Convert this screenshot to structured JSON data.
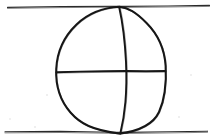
{
  "document": {
    "title": "Hand-drawn sphere construction sketch",
    "medium": "pencil-on-paper-scan",
    "background_color": "#ffffff",
    "ink_color": "#171717",
    "guide_color": "#2a2a2a",
    "width": 214,
    "height": 140
  },
  "figure": {
    "name": "sphere-with-meridian-and-equator",
    "caption": "",
    "labels": []
  },
  "strokes": {
    "top_rule": {
      "name": "top-horizontal-rule",
      "path": "M 7.5 7.4 L 62 6.6 L 112 6.2 L 126 6.4 L 168 6.0 L 209.5 5.4",
      "color": "#2a2a2a"
    },
    "bottom_rule": {
      "name": "bottom-horizontal-rule",
      "path": "M 5.0 131.8 L 60 131.4 L 112 132.2 L 126 132.4 L 170 131.8 L 207.5 131.2",
      "color": "#2a2a2a"
    },
    "circle_outline": {
      "name": "sphere-outline",
      "path": "M 119.5 6.8 C 104 7.6 88 13.5 76.5 24.5 C 64.5 36.0 57.0 52.0 56.2 69.0 C 55.4 86.5 60.5 101.0 70.5 112.5 C 80.5 124.0 92.5 130.0 119.5 133.6 C 143.0 130.5 154.0 122.5 159.0 112.0 C 161.5 106.5 163.4 100.5 164.6 92.0 C 165.8 83.0 166.2 75.0 165.6 66.0 C 164.6 50.0 158.0 34.5 146.5 23.0 C 135.5 12.0 128.5 8.0 119.5 6.8 Z",
      "color": "#171717"
    },
    "meridian": {
      "name": "vertical-meridian-curve",
      "path": "M 119.2 7.2 C 122.5 22.0 125.0 42.0 126.0 62.0 C 126.6 75.5 126.6 88.0 125.4 102.0 C 124.3 114.5 122.5 124.5 120.3 133.5",
      "color": "#171717"
    },
    "equator": {
      "name": "horizontal-equator-line",
      "path": "M 56.4 72.2 L 80 71.6 L 104 71.2 L 126 71.0 L 146 71.2 L 165.4 71.0",
      "color": "#171717"
    }
  },
  "geometry": {
    "top_rule_y": 6.5,
    "bottom_rule_y": 132,
    "equator_y": 71,
    "meridian_apex_x": 119,
    "meridian_base_x": 120,
    "circle_left_x": 56,
    "circle_right_x": 166,
    "center_x": 126,
    "center_y": 71
  }
}
